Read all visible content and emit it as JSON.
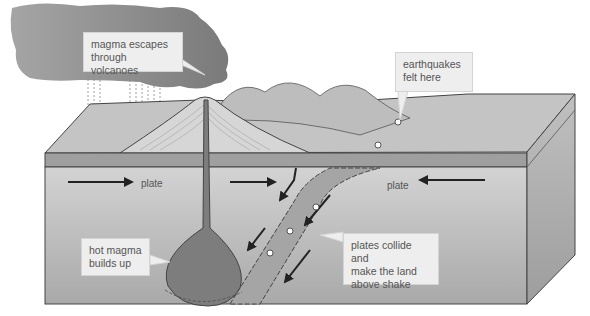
{
  "colors": {
    "background": "#ffffff",
    "cloud": "#8c8c8c",
    "crust_top": "#b5b5b5",
    "crust_band": "#9c9c9c",
    "mantle": "#c8c8c8",
    "side_face": "#b0b0b0",
    "magma": "#7d7d7d",
    "callout_bg": "#eeeeee",
    "text": "#555555",
    "line": "#333333"
  },
  "labels": {
    "volcano": "magma escapes\nthrough volcanoes",
    "earthquakes": "earthquakes\nfelt here",
    "magma_chamber": "hot magma\nbuilds up",
    "collision": "plates collide and\nmake the land\nabove shake",
    "plate_left": "plate",
    "plate_right": "plate"
  },
  "arrows": [
    {
      "name": "left-plate-arrow",
      "direction": "right"
    },
    {
      "name": "right-plate-arrow",
      "direction": "left"
    },
    {
      "name": "subduction-arrows",
      "direction": "down-left",
      "count": 5
    }
  ],
  "markers": {
    "earthquake_foci_surface": 2,
    "earthquake_foci_slab": 3
  }
}
